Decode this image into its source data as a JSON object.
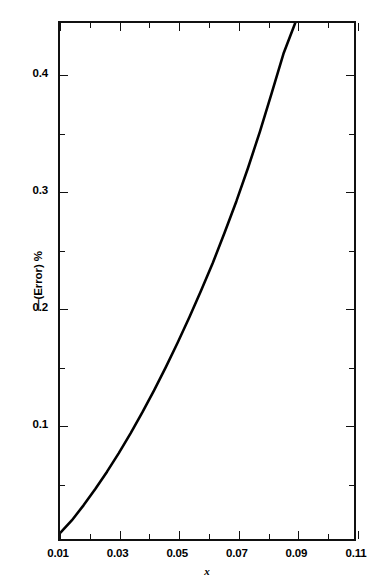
{
  "chart_data": {
    "type": "line",
    "title": "",
    "xlabel": "x",
    "ylabel": "—(Error) %",
    "xlim": [
      0.01,
      0.11
    ],
    "ylim": [
      0.0,
      0.4445
    ],
    "grid": false,
    "legend": null,
    "xticks": [
      0.01,
      0.03,
      0.05,
      0.07,
      0.09,
      0.11
    ],
    "xtick_labels": [
      "0.01",
      "0.03",
      "0.05",
      "0.07",
      "0.09",
      "0.11"
    ],
    "x_minor_ticks": [
      0.02,
      0.04,
      0.06,
      0.08,
      0.1
    ],
    "yticks": [
      0.1,
      0.2,
      0.3,
      0.4
    ],
    "ytick_labels": [
      "0.1",
      "0.2",
      "0.3",
      "0.4"
    ],
    "y_minor_ticks": [
      0.05,
      0.15,
      0.25,
      0.35
    ],
    "series": [
      {
        "name": "error",
        "color": "#000000",
        "linewidth": 2.6,
        "x": [
          0.01,
          0.014,
          0.018,
          0.022,
          0.026,
          0.03,
          0.034,
          0.038,
          0.042,
          0.046,
          0.05,
          0.054,
          0.058,
          0.062,
          0.066,
          0.07,
          0.074,
          0.078,
          0.082,
          0.086,
          0.09
        ],
        "values": [
          0.005,
          0.016,
          0.029,
          0.043,
          0.058,
          0.074,
          0.091,
          0.109,
          0.128,
          0.148,
          0.169,
          0.191,
          0.214,
          0.238,
          0.264,
          0.291,
          0.32,
          0.351,
          0.384,
          0.418,
          0.4445
        ]
      }
    ]
  }
}
